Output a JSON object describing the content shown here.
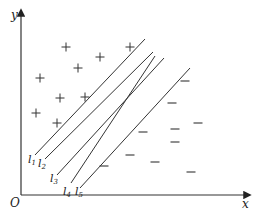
{
  "diagram": {
    "type": "linear-separability",
    "axes": {
      "x_label": "x",
      "y_label": "y",
      "origin_label": "O",
      "origin": [
        21,
        195
      ],
      "x_end": [
        250,
        195
      ],
      "y_end": [
        21,
        10
      ]
    },
    "colors": {
      "axis": "#333333",
      "line": "#333333",
      "marker": "#333333",
      "text": "#222222"
    },
    "lines": [
      {
        "label": "l",
        "sub": "1",
        "x1": 35,
        "y1": 155,
        "x2": 145,
        "y2": 39,
        "lx": 28,
        "ly": 163
      },
      {
        "label": "l",
        "sub": "2",
        "x1": 45,
        "y1": 159,
        "x2": 153,
        "y2": 52,
        "lx": 38,
        "ly": 167
      },
      {
        "label": "l",
        "sub": "3",
        "x1": 57,
        "y1": 175,
        "x2": 164,
        "y2": 58,
        "lx": 50,
        "ly": 182
      },
      {
        "label": "l",
        "sub": "4",
        "x1": 71,
        "y1": 183,
        "x2": 155,
        "y2": 56,
        "lx": 63,
        "ly": 195
      },
      {
        "label": "l",
        "sub": "5",
        "x1": 80,
        "y1": 188,
        "x2": 190,
        "y2": 68,
        "lx": 75,
        "ly": 195
      }
    ],
    "plus_points": [
      [
        66,
        47
      ],
      [
        100,
        57
      ],
      [
        78,
        68
      ],
      [
        130,
        47
      ],
      [
        40,
        78
      ],
      [
        60,
        98
      ],
      [
        85,
        97
      ],
      [
        36,
        113
      ],
      [
        57,
        123
      ]
    ],
    "minus_points": [
      [
        185,
        81
      ],
      [
        172,
        103
      ],
      [
        198,
        123
      ],
      [
        143,
        132
      ],
      [
        175,
        129
      ],
      [
        175,
        142
      ],
      [
        104,
        166
      ],
      [
        130,
        155
      ],
      [
        155,
        162
      ],
      [
        191,
        172
      ]
    ]
  }
}
